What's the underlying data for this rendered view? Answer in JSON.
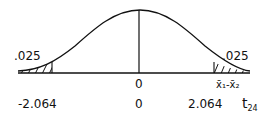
{
  "diagram": {
    "type": "t-distribution",
    "tail_area_left": ".025",
    "tail_area_right": ".025",
    "center_label": "0",
    "x_axis_label_top": "x̄₁-x̄₂",
    "bottom_axis": {
      "left_critical": "-2.064",
      "center": "0",
      "right_critical": "2.064",
      "dist_label_main": "t",
      "dist_label_sub": "24"
    },
    "colors": {
      "ink": "#111111",
      "background": "#ffffff"
    }
  }
}
